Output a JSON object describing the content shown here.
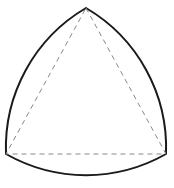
{
  "diagram": {
    "type": "reuleaux-triangle",
    "background": "#ffffff",
    "stroke_color": "#1a1a1a",
    "dash_color": "#888888",
    "vertices": {
      "top": [
        86,
        8
      ],
      "bottom_left": [
        6,
        154
      ],
      "bottom_right": [
        166,
        154
      ]
    },
    "arc_radius": 162
  }
}
